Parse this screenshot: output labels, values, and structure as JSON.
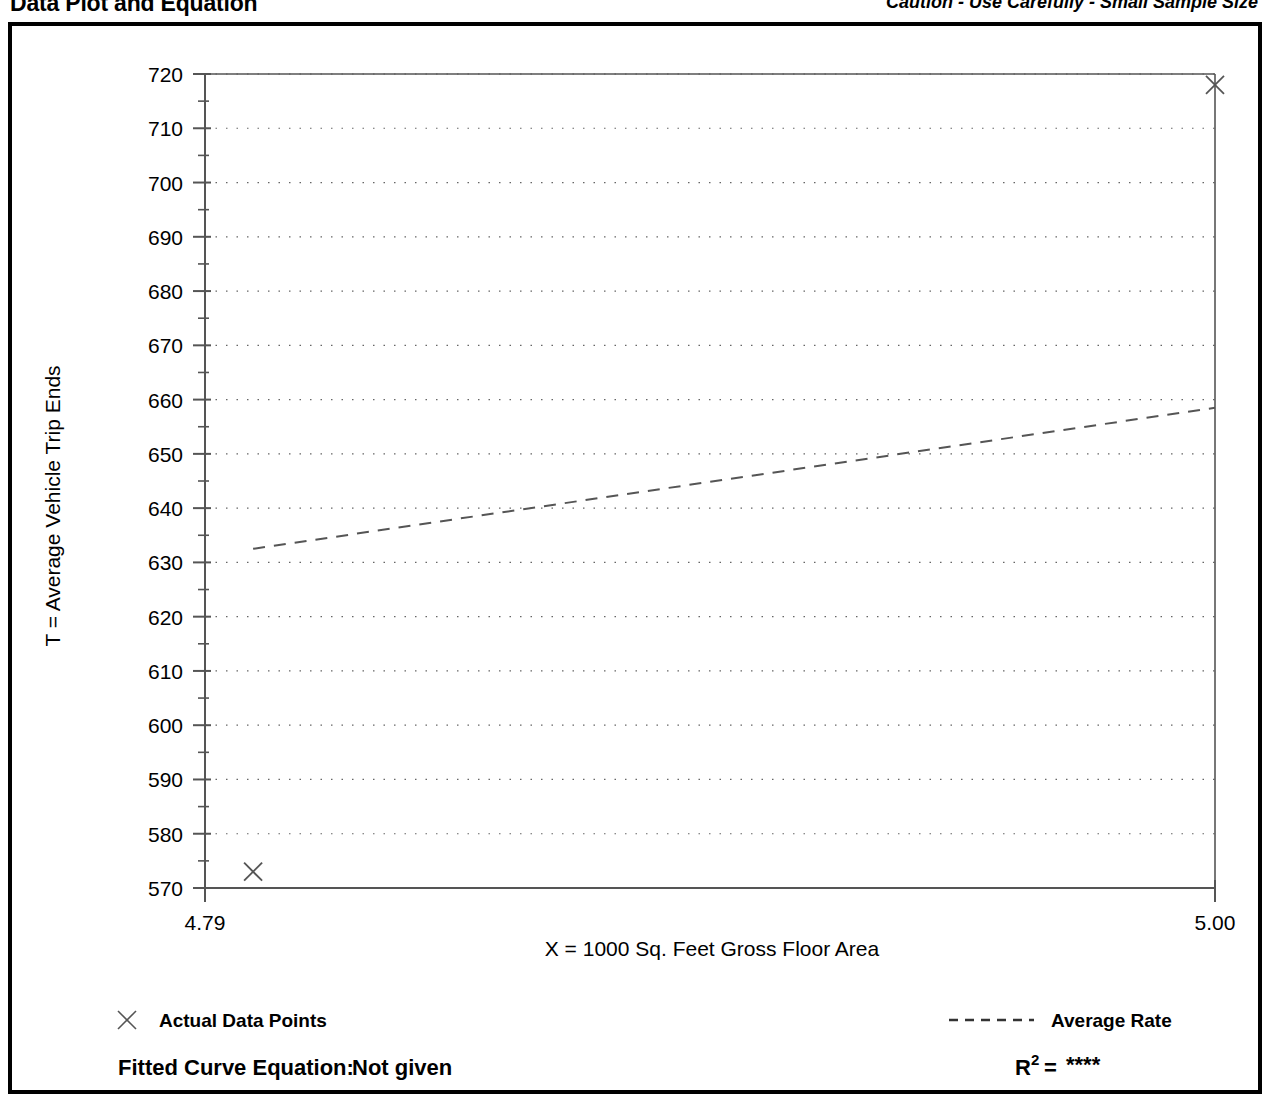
{
  "header": {
    "title": "Data Plot and Equation",
    "caution": "Caution - Use Carefully - Small Sample Size"
  },
  "legend": {
    "data_points_label": "Actual Data Points",
    "average_rate_label": "Average Rate",
    "data_point_marker": "x-marker-icon",
    "average_rate_marker": "dashed-line-icon"
  },
  "equation": {
    "fitted_curve_label": "Fitted Curve Equation:",
    "fitted_curve_value": "Not given",
    "r2_base": "R",
    "r2_exponent": "2",
    "r2_equals": "=",
    "r2_value": "****"
  },
  "colors": {
    "frame": "#000000",
    "axis": "#555555",
    "grid": "#666666",
    "marker": "#555555",
    "trend": "#555555",
    "text": "#000000"
  },
  "chart_data": {
    "type": "scatter",
    "title": "Data Plot and Equation",
    "xlabel": "X = 1000 Sq. Feet Gross Floor Area",
    "ylabel": "T = Average Vehicle Trip Ends",
    "xlim": [
      4.79,
      5.0
    ],
    "ylim": [
      570,
      720
    ],
    "xtick_labels": [
      "4.79",
      "5.00"
    ],
    "xticks": [
      4.79,
      5.0
    ],
    "yticks": [
      570,
      580,
      590,
      600,
      610,
      620,
      630,
      640,
      650,
      660,
      670,
      680,
      690,
      700,
      710,
      720
    ],
    "ytick_labels": [
      "570",
      "580",
      "590",
      "600",
      "610",
      "620",
      "630",
      "640",
      "650",
      "660",
      "670",
      "680",
      "690",
      "700",
      "710",
      "720"
    ],
    "y_minor_tick_step": 5,
    "grid": true,
    "grid_style": "dotted-horizontal",
    "legend_position": "below-plot",
    "points": [
      {
        "x": 4.8,
        "y": 573,
        "marker": "x"
      },
      {
        "x": 5.0,
        "y": 718,
        "marker": "x"
      }
    ],
    "series": [
      {
        "name": "Actual Data Points",
        "type": "scatter",
        "marker": "x",
        "x": [
          4.8,
          5.0
        ],
        "y": [
          573,
          718
        ]
      },
      {
        "name": "Average Rate",
        "type": "line",
        "linestyle": "dashed",
        "x": [
          4.8,
          5.0
        ],
        "y": [
          632.5,
          658.5
        ]
      }
    ]
  }
}
